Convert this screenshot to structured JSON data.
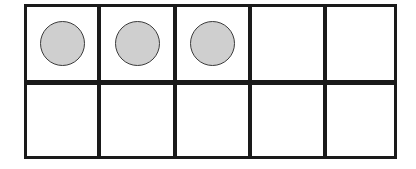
{
  "ten_frame": {
    "rows": 2,
    "columns": 5,
    "filled_count": 3,
    "cells": [
      {
        "row": 0,
        "col": 0,
        "filled": true
      },
      {
        "row": 0,
        "col": 1,
        "filled": true
      },
      {
        "row": 0,
        "col": 2,
        "filled": true
      },
      {
        "row": 0,
        "col": 3,
        "filled": false
      },
      {
        "row": 0,
        "col": 4,
        "filled": false
      },
      {
        "row": 1,
        "col": 0,
        "filled": false
      },
      {
        "row": 1,
        "col": 1,
        "filled": false
      },
      {
        "row": 1,
        "col": 2,
        "filled": false
      },
      {
        "row": 1,
        "col": 3,
        "filled": false
      },
      {
        "row": 1,
        "col": 4,
        "filled": false
      }
    ],
    "colors": {
      "line": "#1a1a1a",
      "counter_fill": "#cfcfcf",
      "counter_stroke": "#3a3a3a",
      "background": "#ffffff"
    }
  }
}
